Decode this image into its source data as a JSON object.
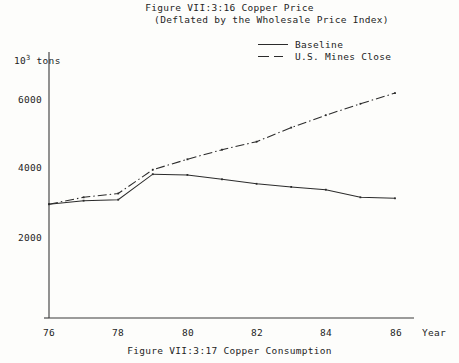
{
  "figure": {
    "title_line1": "Figure VII:3:16  Copper Price",
    "title_line2": "(Deflated by the Wholesale Price Index)",
    "bottom_caption": "Figure VII:3:17  Copper Consumption"
  },
  "legend": {
    "entries": [
      {
        "label": "Baseline",
        "style": "solid",
        "key_name": "legend-key-baseline"
      },
      {
        "label": "U.S. Mines Close",
        "style": "dash-dot",
        "key_name": "legend-key-us-mines-close"
      }
    ]
  },
  "axes": {
    "y_label_prefix": "10",
    "y_label_exponent": "3",
    "y_label_suffix": " tons",
    "x_label": "Year",
    "y_ticks": [
      "6000",
      "4000",
      "2000"
    ],
    "x_ticks": [
      "76",
      "78",
      "80",
      "82",
      "84",
      "86"
    ]
  },
  "chart_data": {
    "type": "line",
    "title": "Figure VII:3:16  Copper Price (Deflated by the Wholesale Price Index)",
    "xlabel": "Year",
    "ylabel": "10^3 tons",
    "x": [
      76,
      77,
      78,
      79,
      80,
      81,
      82,
      83,
      84,
      85,
      86
    ],
    "xlim": [
      76,
      86
    ],
    "ylim": [
      0,
      6600
    ],
    "y_ticks": [
      2000,
      4000,
      6000
    ],
    "grid": false,
    "legend_position": "top-right",
    "series": [
      {
        "name": "Baseline",
        "style": "solid",
        "values": [
          2980,
          3080,
          3110,
          3850,
          3830,
          3700,
          3570,
          3480,
          3400,
          3180,
          3150
        ]
      },
      {
        "name": "U.S. Mines Close",
        "style": "dash-dot",
        "values": [
          2980,
          3180,
          3290,
          3980,
          4280,
          4560,
          4790,
          5200,
          5560,
          5890,
          6200
        ]
      }
    ]
  },
  "plot_geometry": {
    "x_axis_y_px": 318,
    "y_axis_x_px": 49,
    "x_px_per_year": 34.6,
    "y_px_6000": 100,
    "y_px_4000": 168,
    "y_px_2000": 238
  }
}
